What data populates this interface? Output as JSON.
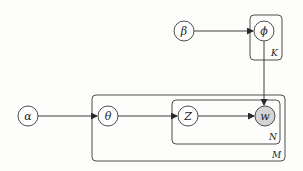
{
  "diagram": {
    "type": "plate-notation",
    "colors": {
      "stroke": "#3a3a3a",
      "observed_fill": "#d4d4d4",
      "latent_fill": "#ffffff"
    },
    "nodes": [
      {
        "id": "alpha",
        "label": "α",
        "cx": 28,
        "cy": 116,
        "observed": false
      },
      {
        "id": "theta",
        "label": "θ",
        "cx": 108,
        "cy": 116,
        "observed": false
      },
      {
        "id": "z",
        "label": "Z",
        "cx": 188,
        "cy": 116,
        "observed": false
      },
      {
        "id": "w",
        "label": "w",
        "cx": 265,
        "cy": 116,
        "observed": true
      },
      {
        "id": "beta",
        "label": "β",
        "cx": 184,
        "cy": 31,
        "observed": false
      },
      {
        "id": "phi",
        "label": "ϕ",
        "cx": 264,
        "cy": 31,
        "observed": false
      }
    ],
    "edges": [
      {
        "from": "alpha",
        "to": "theta"
      },
      {
        "from": "theta",
        "to": "z"
      },
      {
        "from": "z",
        "to": "w"
      },
      {
        "from": "beta",
        "to": "phi"
      },
      {
        "from": "phi",
        "to": "w"
      }
    ],
    "plates": [
      {
        "id": "K",
        "label": "K",
        "x": 250,
        "y": 15,
        "w": 32,
        "h": 45
      },
      {
        "id": "M",
        "label": "M",
        "x": 92,
        "y": 95,
        "w": 193,
        "h": 66
      },
      {
        "id": "N",
        "label": "N",
        "x": 172,
        "y": 100,
        "w": 108,
        "h": 44
      }
    ]
  }
}
